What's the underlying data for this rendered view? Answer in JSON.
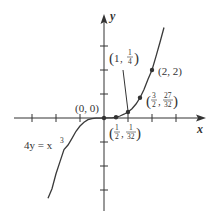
{
  "figure": {
    "equation_label": "4y = x",
    "equation_exponent": "3",
    "axes": {
      "x_label": "x",
      "y_label": "y"
    },
    "origin_label": "(0, 0)",
    "points": [
      {
        "label": "(0, 0)",
        "x": 0,
        "y": 0
      },
      {
        "label_prefix": "",
        "num_x": "1",
        "den_x": "2",
        "num_y": "1",
        "den_y": "32",
        "x": 0.5,
        "y": 0.03125
      },
      {
        "whole_x": "1",
        "num_y": "1",
        "den_y": "4",
        "x": 1,
        "y": 0.25
      },
      {
        "num_x": "3",
        "den_x": "2",
        "num_y": "27",
        "den_y": "32",
        "x": 1.5,
        "y": 0.84375
      },
      {
        "label": "(2, 2)",
        "x": 2,
        "y": 2
      }
    ],
    "comma": ",",
    "lparen": "(",
    "rparen": ")"
  },
  "colors": {
    "ink": "#333333",
    "curve": "#3a3a3a",
    "background": "#ffffff"
  }
}
